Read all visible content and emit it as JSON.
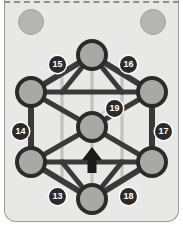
{
  "canvas": {
    "width": 183,
    "height": 234
  },
  "card": {
    "background_color": "#e8e8e6",
    "border_color": "#9a9a98",
    "top_edge_style": "dashed"
  },
  "decorations": [
    {
      "name": "deco-circle-left",
      "cx": 30,
      "cy": 21,
      "r": 12,
      "color": "#b5b5b3"
    },
    {
      "name": "deco-circle-right",
      "cx": 152,
      "cy": 21,
      "r": 12,
      "color": "#b5b5b3"
    }
  ],
  "graph": {
    "node_fill": "#a8a8a6",
    "node_stroke": "#2b2b2b",
    "edge_color": "#3a3a3a",
    "inner_edge_color": "#c2c2c0",
    "nodes": [
      {
        "id": "top",
        "cx": 92,
        "cy": 55,
        "r": 14
      },
      {
        "id": "upper-left",
        "cx": 31,
        "cy": 92,
        "r": 14
      },
      {
        "id": "upper-right",
        "cx": 152,
        "cy": 92,
        "r": 14
      },
      {
        "id": "center",
        "cx": 92,
        "cy": 127,
        "r": 14
      },
      {
        "id": "lower-left",
        "cx": 31,
        "cy": 162,
        "r": 14
      },
      {
        "id": "lower-right",
        "cx": 152,
        "cy": 162,
        "r": 14
      },
      {
        "id": "bottom",
        "cx": 92,
        "cy": 199,
        "r": 14
      }
    ]
  },
  "labels": [
    {
      "text": "13",
      "x": 49,
      "y": 188
    },
    {
      "text": "14",
      "x": 12,
      "y": 123
    },
    {
      "text": "15",
      "x": 49,
      "y": 56
    },
    {
      "text": "16",
      "x": 120,
      "y": 56
    },
    {
      "text": "17",
      "x": 155,
      "y": 123
    },
    {
      "text": "18",
      "x": 120,
      "y": 188
    },
    {
      "text": "19",
      "x": 106,
      "y": 100
    }
  ],
  "arrow": {
    "name": "up-arrow",
    "color": "#1a1a1a",
    "tip_x": 92,
    "tip_y": 148,
    "base_y": 172
  },
  "pointer": {
    "name": "leader-line",
    "from_x": 106,
    "from_y": 108,
    "to_x": 97,
    "to_y": 118,
    "color": "#c8c8c6"
  }
}
